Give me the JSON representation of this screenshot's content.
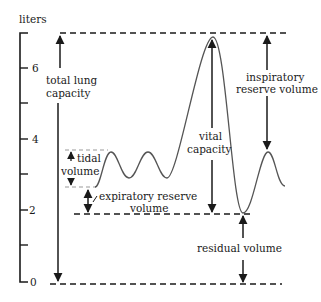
{
  "diagram": {
    "axis": {
      "unit_label": "liters",
      "ticks": [
        {
          "value": 0,
          "label": "0"
        },
        {
          "value": 1,
          "label": ""
        },
        {
          "value": 2,
          "label": "2"
        },
        {
          "value": 3,
          "label": ""
        },
        {
          "value": 4,
          "label": "4"
        },
        {
          "value": 5,
          "label": ""
        },
        {
          "value": 6,
          "label": "6"
        }
      ]
    },
    "labels": {
      "total_lung_capacity_line1": "total lung",
      "total_lung_capacity_line2": "capacity",
      "tidal_volume_line1": "tidal",
      "tidal_volume_line2": "volume",
      "expiratory_reserve_line1": "expiratory reserve",
      "expiratory_reserve_line2": "volume",
      "vital_capacity_line1": "vital",
      "vital_capacity_line2": "capacity",
      "inspiratory_reserve_line1": "inspiratory",
      "inspiratory_reserve_line2": "reserve volume",
      "residual_volume": "residual volume"
    },
    "levels_liters": {
      "total_lung_capacity": 7.0,
      "tidal_top": 3.7,
      "tidal_bottom": 2.7,
      "expiratory_reserve_bottom": 1.9,
      "residual_floor": 0
    },
    "colors": {
      "line": "#1a1a1a",
      "trace": "#555555",
      "guide": "#999999"
    }
  }
}
